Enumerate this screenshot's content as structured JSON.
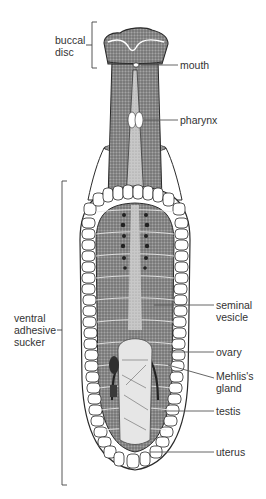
{
  "diagram": {
    "labels": {
      "buccal_disc": "buccal\ndisc",
      "mouth": "mouth",
      "pharynx": "pharynx",
      "ventral_adhesive_sucker": "ventral\nadhesive\nsucker",
      "seminal_vesicle": "seminal\nvesicle",
      "ovary": "ovary",
      "mehlis_gland": "Mehlis's\ngland",
      "testis": "testis",
      "uterus": "uterus"
    },
    "colors": {
      "body_fill": "#8a8a8a",
      "body_dark": "#5a5a5a",
      "pale_fill": "#d4d4d4",
      "outline": "#2a2a2a",
      "leader_line": "#555555",
      "loculi_fill": "#ffffff"
    }
  }
}
